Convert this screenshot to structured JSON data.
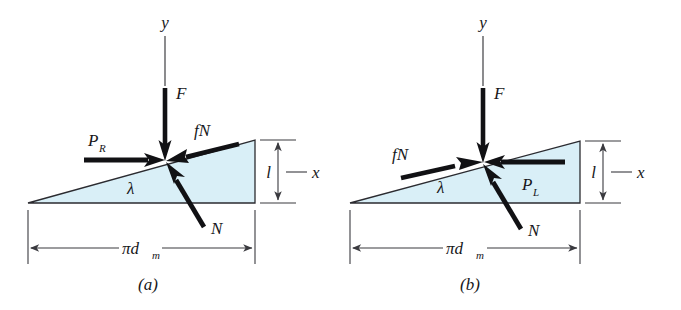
{
  "figure": {
    "background_color": "#ffffff",
    "triangle_fill": "#d9eff7",
    "triangle_stroke": "#2b2b30",
    "ink_color": "#111114"
  },
  "panels": [
    {
      "id": "a",
      "caption": "(a)",
      "axis_y_label": "y",
      "axis_x_label": "x",
      "labels": {
        "force_F": "F",
        "force_P": "P",
        "force_P_sub": "R",
        "friction": "fN",
        "normal": "N",
        "lead_angle": "λ",
        "lead": "l",
        "circumference": "πd",
        "circumference_sub": "m"
      },
      "arrows": {
        "F_direction": "down",
        "P_direction": "right",
        "fN_direction": "down-left",
        "N_direction": "up-left"
      }
    },
    {
      "id": "b",
      "caption": "(b)",
      "axis_y_label": "y",
      "axis_x_label": "x",
      "labels": {
        "force_F": "F",
        "force_P": "P",
        "force_P_sub": "L",
        "friction": "fN",
        "normal": "N",
        "lead_angle": "λ",
        "lead": "l",
        "circumference": "πd",
        "circumference_sub": "m"
      },
      "arrows": {
        "F_direction": "down",
        "P_direction": "left",
        "fN_direction": "up-right",
        "N_direction": "up-left"
      }
    }
  ]
}
